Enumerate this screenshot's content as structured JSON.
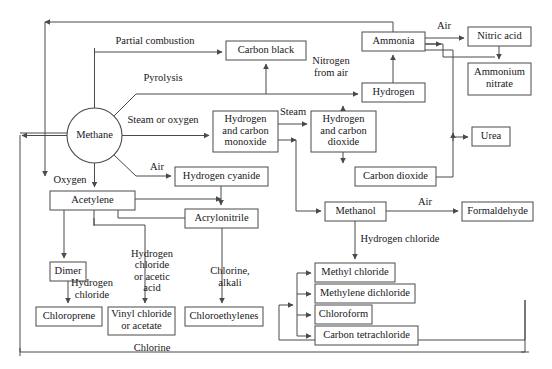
{
  "diagram": {
    "type": "flowchart",
    "colors": {
      "background": "#ffffff",
      "stroke": "#4a4a4a",
      "text": "#17171a"
    },
    "nodes": [
      {
        "id": "methane",
        "label": "Methane",
        "shape": "circle",
        "cx": 94.5,
        "cy": 135.5,
        "r": 27.5
      },
      {
        "id": "carbon_black",
        "label": "Carbon black",
        "shape": "rect",
        "x": 226,
        "y": 41,
        "w": 80,
        "h": 19
      },
      {
        "id": "ammonia",
        "label": "Ammonia",
        "shape": "rect",
        "x": 362,
        "y": 32,
        "w": 63,
        "h": 19
      },
      {
        "id": "nitric_acid",
        "label": "Nitric acid",
        "shape": "rect",
        "x": 468,
        "y": 27,
        "w": 63,
        "h": 19
      },
      {
        "id": "ammonium_nitrate",
        "label": "Ammonium\nnitrate",
        "shape": "rect",
        "x": 468,
        "y": 63,
        "w": 63,
        "h": 32
      },
      {
        "id": "hydrogen",
        "label": "Hydrogen",
        "shape": "rect",
        "x": 362,
        "y": 83,
        "w": 63,
        "h": 19
      },
      {
        "id": "h2_co",
        "label": "Hydrogen\nand carbon\nmonoxide",
        "shape": "rect",
        "x": 213,
        "y": 111,
        "w": 65,
        "h": 41
      },
      {
        "id": "h2_co2",
        "label": "Hydrogen\nand carbon\ndioxide",
        "shape": "rect",
        "x": 311,
        "y": 111,
        "w": 65,
        "h": 41
      },
      {
        "id": "urea",
        "label": "Urea",
        "shape": "rect",
        "x": 472,
        "y": 127,
        "w": 38,
        "h": 19
      },
      {
        "id": "carbon_dioxide",
        "label": "Carbon dioxide",
        "shape": "rect",
        "x": 355,
        "y": 167,
        "w": 81,
        "h": 19
      },
      {
        "id": "hydrogen_cyanide",
        "label": "Hydrogen cyanide",
        "shape": "rect",
        "x": 175,
        "y": 167,
        "w": 93,
        "h": 19
      },
      {
        "id": "acetylene",
        "label": "Acetylene",
        "shape": "rect",
        "x": 50,
        "y": 191,
        "w": 85,
        "h": 19
      },
      {
        "id": "acrylonitrile",
        "label": "Acrylonitrile",
        "shape": "rect",
        "x": 185,
        "y": 209,
        "w": 73,
        "h": 19
      },
      {
        "id": "methanol",
        "label": "Methanol",
        "shape": "rect",
        "x": 325,
        "y": 202,
        "w": 61,
        "h": 19
      },
      {
        "id": "formaldehyde",
        "label": "Formaldehyde",
        "shape": "rect",
        "x": 462,
        "y": 202,
        "w": 71,
        "h": 19
      },
      {
        "id": "dimer",
        "label": "Dimer",
        "shape": "rect",
        "x": 50,
        "y": 262,
        "w": 36,
        "h": 19
      },
      {
        "id": "methyl_chloride",
        "label": "Methyl chloride",
        "shape": "rect",
        "x": 315,
        "y": 263,
        "w": 80,
        "h": 19
      },
      {
        "id": "methylene_dichloride",
        "label": "Methylene dichloride",
        "shape": "rect",
        "x": 315,
        "y": 284,
        "w": 100,
        "h": 19
      },
      {
        "id": "chloroform",
        "label": "Chloroform",
        "shape": "rect",
        "x": 315,
        "y": 305,
        "w": 57,
        "h": 19
      },
      {
        "id": "carbon_tetrachloride",
        "label": "Carbon tetrachloride",
        "shape": "rect",
        "x": 315,
        "y": 326,
        "w": 103,
        "h": 19
      },
      {
        "id": "chloroprene",
        "label": "Chloroprene",
        "shape": "rect",
        "x": 36,
        "y": 307,
        "w": 66,
        "h": 19
      },
      {
        "id": "vinyl_chloride",
        "label": "Vinyl chloride\nor acetate",
        "shape": "rect",
        "x": 108,
        "y": 307,
        "w": 67,
        "h": 28
      },
      {
        "id": "chloroethylenes",
        "label": "Chloroethylenes",
        "shape": "rect",
        "x": 185,
        "y": 307,
        "w": 78,
        "h": 19
      }
    ],
    "edge_labels": [
      {
        "id": "partial_combustion",
        "text": "Partial combustion",
        "x": 155,
        "y": 42
      },
      {
        "id": "pyrolysis",
        "text": "Pyrolysis",
        "x": 163,
        "y": 79
      },
      {
        "id": "steam_or_oxygen",
        "text": "Steam or oxygen",
        "x": 163,
        "y": 121
      },
      {
        "id": "air_hcn",
        "text": "Air",
        "x": 157,
        "y": 168
      },
      {
        "id": "oxygen",
        "text": "Oxygen",
        "x": 70,
        "y": 181
      },
      {
        "id": "steam",
        "text": "Steam",
        "x": 293,
        "y": 113
      },
      {
        "id": "air_nitric",
        "text": "Air",
        "x": 444,
        "y": 27
      },
      {
        "id": "nitrogen_from_air",
        "text": "Nitrogen\nfrom air",
        "x": 331,
        "y": 68
      },
      {
        "id": "air_formaldehyde",
        "text": "Air",
        "x": 425,
        "y": 203
      },
      {
        "id": "hydrogen_chloride_me",
        "text": "Hydrogen chloride",
        "x": 400,
        "y": 240
      },
      {
        "id": "hydrogen_chloride_dm",
        "text": "Hydrogen\nchloride",
        "x": 92,
        "y": 290
      },
      {
        "id": "hcl_or_acetic",
        "text": "Hydrogen\nchloride\nor acetic\nacid",
        "x": 152,
        "y": 272
      },
      {
        "id": "chlorine_alkali",
        "text": "Chlorine,\nalkali",
        "x": 230,
        "y": 278
      },
      {
        "id": "chlorine_bottom",
        "text": "Chlorine",
        "x": 152,
        "y": 349
      }
    ]
  }
}
